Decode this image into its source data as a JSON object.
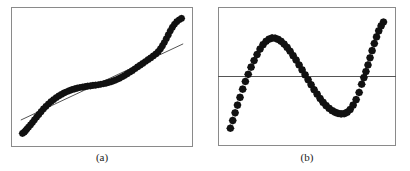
{
  "figure": {
    "background_color": "#ffffff",
    "frame_color": "#8a8a8a",
    "marker_color": "#111111",
    "line_color": "#555555",
    "panels": [
      {
        "id": "a",
        "caption": "(a)"
      },
      {
        "id": "b",
        "caption": "(b)"
      }
    ]
  },
  "chart_data": [
    {
      "type": "scatter",
      "panel": "a",
      "title": "",
      "subtitle": "",
      "xlabel": "",
      "ylabel": "",
      "xlim": [
        0,
        100
      ],
      "ylim": [
        0,
        100
      ],
      "grid": false,
      "legend": "none",
      "annotations": [
        "(a)"
      ],
      "series": [
        {
          "name": "observations",
          "marker": "filled-diamond",
          "x": [
            1.5,
            2.6,
            3.4,
            4.2,
            5.2,
            6.4,
            7.6,
            8.8,
            10.1,
            11.5,
            12.9,
            14.3,
            15.8,
            17.3,
            18.9,
            20.5,
            22.1,
            23.7,
            25.3,
            26.9,
            28.5,
            30.1,
            31.7,
            33.3,
            34.9,
            36.5,
            38.1,
            39.7,
            41.3,
            42.9,
            44.5,
            46.1,
            47.7,
            49.3,
            50.9,
            52.5,
            54.1,
            55.7,
            57.3,
            58.9,
            60.5,
            62.1,
            63.7,
            65.3,
            66.9,
            68.5,
            70.1,
            71.7,
            73.3,
            74.9,
            76.5,
            78.1,
            79.7,
            81.3,
            82.9,
            84.3,
            85.6,
            86.8,
            88.0,
            89.2,
            90.4,
            91.6,
            92.9,
            94.2,
            95.6,
            97.1,
            98.5
          ],
          "y": [
            3.0,
            4.0,
            5.2,
            6.6,
            8.2,
            10.0,
            12.0,
            14.2,
            16.4,
            18.7,
            21.0,
            23.2,
            25.3,
            27.3,
            29.2,
            30.9,
            32.5,
            34.0,
            35.3,
            36.4,
            37.4,
            38.3,
            39.1,
            39.8,
            40.4,
            40.9,
            41.3,
            41.7,
            42.0,
            42.3,
            42.6,
            42.9,
            43.2,
            43.6,
            44.0,
            44.5,
            45.1,
            45.8,
            46.6,
            47.5,
            48.5,
            49.6,
            50.8,
            52.1,
            53.5,
            54.9,
            56.4,
            57.9,
            59.4,
            60.9,
            62.4,
            63.9,
            65.4,
            67.0,
            68.7,
            70.6,
            72.8,
            75.3,
            78.1,
            81.2,
            84.4,
            87.6,
            90.6,
            93.2,
            95.3,
            96.9,
            98.0
          ]
        }
      ],
      "fit_line": {
        "name": "least-squares fit",
        "style": "solid",
        "x": [
          0.5,
          99.5
        ],
        "y": [
          14.0,
          77.0
        ]
      }
    },
    {
      "type": "scatter",
      "panel": "b",
      "title": "",
      "subtitle": "",
      "xlabel": "",
      "ylabel": "",
      "xlim": [
        0,
        100
      ],
      "ylim": [
        -55,
        55
      ],
      "grid": false,
      "legend": "none",
      "annotations": [
        "(b)"
      ],
      "reference_line": {
        "name": "zero-residual line",
        "orientation": "horizontal",
        "y": 0,
        "style": "solid"
      },
      "series": [
        {
          "name": "residuals",
          "marker": "filled-diamond",
          "x": [
            1.5,
            3.0,
            4.5,
            6.0,
            7.6,
            9.3,
            11.0,
            12.8,
            14.6,
            16.5,
            18.4,
            20.3,
            22.2,
            24.1,
            26.0,
            27.9,
            29.8,
            31.7,
            33.6,
            35.5,
            37.4,
            39.3,
            41.2,
            43.1,
            45.0,
            46.9,
            48.8,
            50.7,
            52.6,
            54.5,
            56.4,
            58.3,
            60.2,
            62.1,
            64.0,
            65.9,
            67.8,
            69.7,
            71.6,
            73.5,
            75.4,
            77.3,
            79.2,
            81.1,
            83.0,
            84.6,
            86.0,
            87.3,
            88.6,
            89.9,
            91.2,
            92.6,
            94.0,
            95.4,
            96.9,
            98.4
          ],
          "y": [
            -47.0,
            -40.0,
            -33.0,
            -26.0,
            -19.0,
            -11.5,
            -4.5,
            2.0,
            8.5,
            14.5,
            20.0,
            25.0,
            29.0,
            32.0,
            34.0,
            35.0,
            34.8,
            33.8,
            32.0,
            29.5,
            26.5,
            23.0,
            19.0,
            15.0,
            10.5,
            6.0,
            1.5,
            -3.0,
            -7.5,
            -12.0,
            -16.0,
            -20.0,
            -23.5,
            -26.5,
            -29.0,
            -31.0,
            -32.5,
            -33.5,
            -34.0,
            -33.8,
            -32.5,
            -30.0,
            -26.0,
            -21.0,
            -14.5,
            -7.0,
            -1.0,
            4.5,
            10.5,
            17.0,
            23.5,
            30.0,
            36.0,
            41.5,
            46.0,
            49.5
          ]
        }
      ]
    }
  ]
}
